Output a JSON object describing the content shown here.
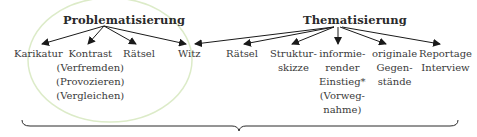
{
  "diagram": {
    "left_group": {
      "title": "Problematisierung",
      "items": [
        {
          "lines": [
            "Karikatur"
          ]
        },
        {
          "lines": [
            "Kontrast",
            "(Verfremden)",
            "(Provozieren)",
            "(Vergleichen)"
          ]
        },
        {
          "lines": [
            "Rätsel"
          ]
        },
        {
          "lines": [
            "Witz"
          ]
        }
      ],
      "highlight_color": "#d8ecc4"
    },
    "right_group": {
      "title": "Thematisierung",
      "items": [
        {
          "lines": [
            "Witz"
          ]
        },
        {
          "lines": [
            "Rätsel"
          ]
        },
        {
          "lines": [
            "Struktur-",
            "skizze"
          ]
        },
        {
          "lines": [
            "informie-",
            "render",
            "Einstieg*",
            "(Vorweg-",
            "nahme)"
          ]
        },
        {
          "lines": [
            "originale",
            "Gegen-",
            "stände"
          ]
        },
        {
          "lines": [
            "Reportage",
            "Interview"
          ]
        }
      ]
    },
    "brace": "underbrace spanning all items"
  }
}
